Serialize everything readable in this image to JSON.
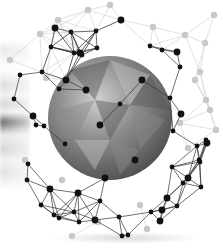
{
  "image": {
    "description": "Geodesic network sphere of black nodes and connecting lines around a gray polygonal globe",
    "width": 223,
    "height": 249,
    "colors": {
      "background": "#ffffff",
      "node_front": "#111111",
      "node_back": "#c8c8c8",
      "line_front": "#333333",
      "line_back": "#cfcfcf",
      "globe_dark": "#555555",
      "globe_mid": "#8a8a8a",
      "globe_light": "#c4c4c4"
    },
    "globe": {
      "cx": 110,
      "cy": 118,
      "r": 62
    },
    "front_nodes": [
      [
        55,
        28
      ],
      [
        71,
        32
      ],
      [
        96,
        31
      ],
      [
        121,
        20
      ],
      [
        51,
        47
      ],
      [
        74,
        53
      ],
      [
        80,
        53
      ],
      [
        82,
        55
      ],
      [
        42,
        72
      ],
      [
        66,
        80
      ],
      [
        150,
        46
      ],
      [
        162,
        50
      ],
      [
        177,
        52
      ],
      [
        180,
        67
      ],
      [
        97,
        48
      ],
      [
        142,
        80
      ],
      [
        170,
        98
      ],
      [
        173,
        131
      ],
      [
        181,
        114
      ],
      [
        20,
        75
      ],
      [
        14,
        99
      ],
      [
        33,
        116
      ],
      [
        36,
        125
      ],
      [
        120,
        104
      ],
      [
        86,
        90
      ],
      [
        59,
        89
      ],
      [
        65,
        144
      ],
      [
        100,
        125
      ],
      [
        28,
        164
      ],
      [
        27,
        180
      ],
      [
        50,
        189
      ],
      [
        59,
        218
      ],
      [
        74,
        212
      ],
      [
        105,
        178
      ],
      [
        119,
        217
      ],
      [
        128,
        235
      ],
      [
        135,
        160
      ],
      [
        172,
        167
      ],
      [
        183,
        183
      ],
      [
        167,
        198
      ],
      [
        177,
        206
      ],
      [
        151,
        212
      ],
      [
        162,
        210
      ],
      [
        206,
        140
      ],
      [
        199,
        160
      ],
      [
        188,
        178
      ],
      [
        122,
        236
      ],
      [
        79,
        222
      ],
      [
        95,
        220
      ],
      [
        41,
        205
      ],
      [
        54,
        215
      ],
      [
        78,
        193
      ],
      [
        201,
        187
      ],
      [
        200,
        162
      ],
      [
        207,
        143
      ],
      [
        44,
        126
      ],
      [
        100,
        201
      ],
      [
        160,
        221
      ],
      [
        197,
        146
      ]
    ],
    "back_nodes": [
      [
        58,
        20
      ],
      [
        88,
        10
      ],
      [
        46,
        78
      ],
      [
        110,
        5
      ],
      [
        153,
        27
      ],
      [
        185,
        35
      ],
      [
        205,
        43
      ],
      [
        214,
        15
      ],
      [
        200,
        72
      ],
      [
        195,
        80
      ],
      [
        210,
        110
      ],
      [
        216,
        130
      ],
      [
        40,
        34
      ],
      [
        10,
        60
      ],
      [
        25,
        160
      ],
      [
        62,
        180
      ],
      [
        180,
        123
      ],
      [
        188,
        148
      ],
      [
        206,
        100
      ],
      [
        147,
        229
      ],
      [
        140,
        205
      ],
      [
        72,
        236
      ],
      [
        98,
        222
      ]
    ]
  }
}
